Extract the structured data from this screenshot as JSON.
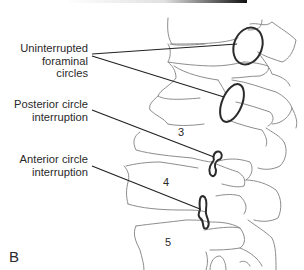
{
  "figure": {
    "panel_letter": "B",
    "labels": {
      "uninterrupted": [
        "Uninterrupted",
        "foraminal circles"
      ],
      "posterior": [
        "Posterior circle",
        "interruption"
      ],
      "anterior": [
        "Anterior circle",
        "interruption"
      ]
    },
    "vertebra_numbers": [
      "3",
      "4",
      "5"
    ],
    "colors": {
      "line": "#8a8a8a",
      "outline": "#2b2b2b",
      "text": "#2a2a2a"
    }
  }
}
